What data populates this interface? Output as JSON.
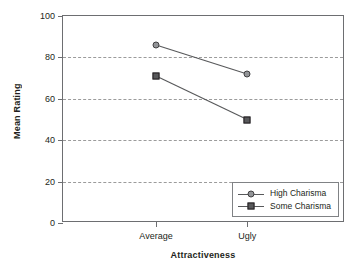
{
  "chart_data": {
    "type": "line",
    "title": "",
    "xlabel": "Attractiveness",
    "ylabel": "Mean Rating",
    "categories": [
      "Average",
      "Ugly"
    ],
    "series": [
      {
        "name": "High Charisma",
        "marker": "circle",
        "values": [
          86,
          72
        ],
        "color": "#939598",
        "edge_color": "#414042"
      },
      {
        "name": "Some Charisma",
        "marker": "square",
        "values": [
          71,
          50
        ],
        "color": "#58595b",
        "edge_color": "#231f20"
      }
    ],
    "ylim": [
      0,
      100
    ],
    "yticks": [
      0,
      20,
      40,
      60,
      80,
      100
    ],
    "ytick_labels": [
      "0",
      "20",
      "40",
      "60",
      "80",
      "100"
    ],
    "gridlines": [
      20,
      40,
      60,
      80
    ],
    "grid": true,
    "grid_style": "dashed",
    "grid_color": "#9b9b9b",
    "legend_position": "bottom-right-inside",
    "line_color": "#58595b",
    "axis_color": "#6d6e71",
    "background": "#ffffff"
  },
  "legend": {
    "entries": [
      {
        "label": "High Charisma"
      },
      {
        "label": "Some Charisma"
      }
    ]
  }
}
